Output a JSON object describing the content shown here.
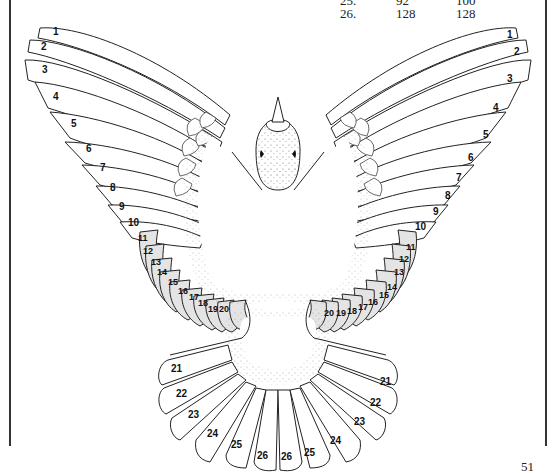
{
  "table_fragment": {
    "rows": [
      {
        "feather": "25.",
        "col2": "92",
        "col3": "100"
      },
      {
        "feather": "26.",
        "col2": "128",
        "col3": "128"
      }
    ]
  },
  "diagram": {
    "left_primaries": [
      "1",
      "2",
      "3",
      "4",
      "5",
      "6",
      "7",
      "8",
      "9",
      "10"
    ],
    "left_secondaries": [
      "11",
      "12",
      "13",
      "14",
      "15",
      "16",
      "17",
      "18",
      "19",
      "20"
    ],
    "right_primaries": [
      "1",
      "2",
      "3",
      "4",
      "5",
      "6",
      "7",
      "8",
      "9",
      "10"
    ],
    "right_secondaries": [
      "11",
      "12",
      "13",
      "14",
      "15",
      "16",
      "17",
      "18",
      "19",
      "20"
    ],
    "tail_left": [
      "21",
      "22",
      "23",
      "24",
      "25",
      "26"
    ],
    "tail_right": [
      "26",
      "25",
      "24",
      "23",
      "22",
      "21"
    ]
  },
  "page_number": "51"
}
